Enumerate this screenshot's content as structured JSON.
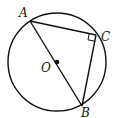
{
  "diagram": {
    "type": "geometry",
    "circle": {
      "center": "O",
      "cx": 57,
      "cy": 62,
      "r": 49
    },
    "points": {
      "A": {
        "label": "A",
        "x": 30,
        "y": 21
      },
      "B": {
        "label": "B",
        "x": 82,
        "y": 106
      },
      "C": {
        "label": "C",
        "x": 96,
        "y": 35
      },
      "O": {
        "label": "O",
        "x": 57,
        "y": 62
      }
    },
    "segments": [
      "AB",
      "AC",
      "CB"
    ],
    "right_angle_at": "C",
    "colors": {
      "stroke": "#111111",
      "background": "#ffffff"
    }
  }
}
